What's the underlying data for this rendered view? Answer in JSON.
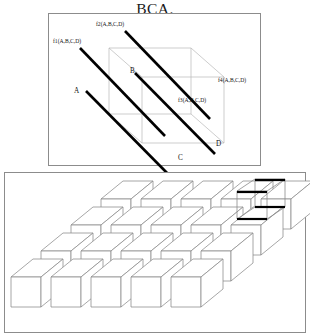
{
  "title": "BCA.",
  "panels": {
    "top": {
      "name": "cube-diagram-panel",
      "function_labels": [
        {
          "id": "f1",
          "text": "f1(A,B,C,D)",
          "x": 4,
          "y": 26
        },
        {
          "id": "f2",
          "text": "f2(A,B,C,D)",
          "x": 46,
          "y": 9
        },
        {
          "id": "f3",
          "text": "f3(A,B,C,D)",
          "x": 130,
          "y": 85
        },
        {
          "id": "f4",
          "text": "f4(A,B,C,D)",
          "x": 170,
          "y": 65
        }
      ],
      "vertex_labels": [
        {
          "id": "A",
          "text": "A",
          "x": 25,
          "y": 77
        },
        {
          "id": "B",
          "text": "B",
          "x": 81,
          "y": 57
        },
        {
          "id": "C",
          "text": "C",
          "x": 130,
          "y": 143
        },
        {
          "id": "D",
          "text": "D",
          "x": 168,
          "y": 129
        }
      ],
      "bold_lines": [
        {
          "id": "f1",
          "x1": 31,
          "y1": 34,
          "x2": 116,
          "y2": 122
        },
        {
          "id": "f2",
          "x1": 76,
          "y1": 17,
          "x2": 161,
          "y2": 105
        },
        {
          "id": "f3",
          "x1": 86,
          "y1": 59,
          "x2": 166,
          "y2": 140
        },
        {
          "id": "f4",
          "x1": 37,
          "y1": 77,
          "x2": 124,
          "y2": 165
        }
      ],
      "wire_color": "#b8b8b8",
      "bold_color": "#000000"
    },
    "bottom": {
      "name": "cube-stack-panel",
      "grid": {
        "rows": 4,
        "cols": 5
      },
      "inset": {
        "name": "cube-highlight-inset",
        "x": 232,
        "y": 6
      }
    }
  },
  "colors": {
    "panel_border": "#8c8c8c",
    "ink": "#111111",
    "wireframe": "#b8b8b8",
    "cube_edge": "#8a8a8a",
    "cube_face": "#ffffff"
  }
}
